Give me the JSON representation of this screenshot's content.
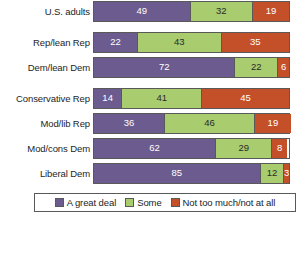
{
  "chart_data": {
    "type": "bar",
    "orientation": "horizontal",
    "stacked": true,
    "title": "",
    "xlabel": "",
    "ylabel": "",
    "xlim": [
      0,
      100
    ],
    "grid": false,
    "legend_position": "bottom",
    "categories": [
      "U.S. adults",
      "Rep/lean Rep",
      "Dem/lean Dem",
      "Conservative Rep",
      "Mod/lib Rep",
      "Mod/cons Dem",
      "Liberal Dem"
    ],
    "series": [
      {
        "name": "A great deal",
        "color": "#6b5b8e",
        "values": [
          49,
          22,
          72,
          14,
          36,
          62,
          85
        ]
      },
      {
        "name": "Some",
        "color": "#a8cc6e",
        "values": [
          32,
          43,
          22,
          41,
          46,
          29,
          12
        ]
      },
      {
        "name": "Not too much/not at all",
        "color": "#c4502a",
        "values": [
          19,
          35,
          6,
          45,
          19,
          8,
          3
        ]
      }
    ]
  },
  "groups": [
    {
      "rows": [
        {
          "label": "U.S. adults",
          "segments": [
            {
              "key": "great",
              "value": "49"
            },
            {
              "key": "some",
              "value": "32"
            },
            {
              "key": "nottoo",
              "value": "19"
            }
          ]
        }
      ]
    },
    {
      "rows": [
        {
          "label": "Rep/lean Rep",
          "segments": [
            {
              "key": "great",
              "value": "22"
            },
            {
              "key": "some",
              "value": "43"
            },
            {
              "key": "nottoo",
              "value": "35"
            }
          ]
        },
        {
          "label": "Dem/lean Dem",
          "segments": [
            {
              "key": "great",
              "value": "72"
            },
            {
              "key": "some",
              "value": "22"
            },
            {
              "key": "nottoo",
              "value": "6"
            }
          ]
        }
      ]
    },
    {
      "rows": [
        {
          "label": "Conservative Rep",
          "segments": [
            {
              "key": "great",
              "value": "14"
            },
            {
              "key": "some",
              "value": "41"
            },
            {
              "key": "nottoo",
              "value": "45"
            }
          ]
        },
        {
          "label": "Mod/lib Rep",
          "segments": [
            {
              "key": "great",
              "value": "36"
            },
            {
              "key": "some",
              "value": "46"
            },
            {
              "key": "nottoo",
              "value": "19"
            }
          ]
        },
        {
          "label": "Mod/cons Dem",
          "segments": [
            {
              "key": "great",
              "value": "62"
            },
            {
              "key": "some",
              "value": "29"
            },
            {
              "key": "nottoo",
              "value": "8"
            }
          ]
        },
        {
          "label": "Liberal Dem",
          "segments": [
            {
              "key": "great",
              "value": "85"
            },
            {
              "key": "some",
              "value": "12"
            },
            {
              "key": "nottoo",
              "value": "3"
            }
          ]
        }
      ]
    }
  ],
  "legend": {
    "items": [
      {
        "key": "great",
        "label": "A great deal"
      },
      {
        "key": "some",
        "label": "Some"
      },
      {
        "key": "nottoo",
        "label": "Not too much/not at all"
      }
    ]
  },
  "colors": {
    "great_deal": "#6b5b8e",
    "some": "#a8cc6e",
    "not_too_much": "#c4502a",
    "outline": "#595959",
    "text": "#221e1f",
    "background": "#ffffff"
  }
}
